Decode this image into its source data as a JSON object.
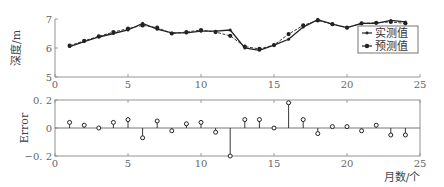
{
  "chart_data": [
    {
      "type": "line",
      "title": "",
      "xlabel": "",
      "ylabel": "深度/m",
      "xlim": [
        0,
        25
      ],
      "ylim": [
        5,
        7
      ],
      "xticks": [
        0,
        5,
        10,
        15,
        20,
        25
      ],
      "yticks": [
        5,
        6,
        7
      ],
      "grid": false,
      "legend_position": "inside-right",
      "x": [
        1,
        2,
        3,
        4,
        5,
        6,
        7,
        8,
        9,
        10,
        11,
        12,
        13,
        14,
        15,
        16,
        17,
        18,
        19,
        20,
        21,
        22,
        23,
        24
      ],
      "series": [
        {
          "name": "实测值",
          "marker": "dot-small",
          "line": "solid",
          "values": [
            6.05,
            6.22,
            6.38,
            6.5,
            6.62,
            6.85,
            6.65,
            6.52,
            6.52,
            6.58,
            6.58,
            6.62,
            6.0,
            5.92,
            6.1,
            6.3,
            6.72,
            6.98,
            6.82,
            6.7,
            6.85,
            6.85,
            6.95,
            6.9
          ]
        },
        {
          "name": "预测值",
          "marker": "dot",
          "line": "dashed",
          "values": [
            6.08,
            6.25,
            6.4,
            6.55,
            6.67,
            6.78,
            6.7,
            6.5,
            6.55,
            6.62,
            6.55,
            6.42,
            6.05,
            5.97,
            6.1,
            6.48,
            6.78,
            6.95,
            6.82,
            6.7,
            6.85,
            6.87,
            6.9,
            6.85
          ]
        }
      ]
    },
    {
      "type": "stem",
      "title": "",
      "xlabel": "月数/个",
      "ylabel": "Error",
      "xlim": [
        0,
        25
      ],
      "ylim": [
        -0.2,
        0.2
      ],
      "xticks": [
        0,
        5,
        10,
        15,
        20,
        25
      ],
      "yticks": [
        -0.2,
        0,
        0.2
      ],
      "ytick_labels": [
        "−0. 2",
        "0",
        "0. 2"
      ],
      "grid": false,
      "x": [
        1,
        2,
        3,
        4,
        5,
        6,
        7,
        8,
        9,
        10,
        11,
        12,
        13,
        14,
        15,
        16,
        17,
        18,
        19,
        20,
        21,
        22,
        23,
        24
      ],
      "series": [
        {
          "name": "Error",
          "values": [
            0.04,
            0.02,
            0.0,
            0.04,
            0.06,
            -0.07,
            0.05,
            -0.02,
            0.03,
            0.04,
            -0.03,
            -0.2,
            0.06,
            0.06,
            0.0,
            0.18,
            0.06,
            -0.04,
            0.01,
            0.01,
            -0.02,
            0.02,
            -0.05,
            -0.05
          ]
        }
      ]
    }
  ],
  "colors": {
    "axis": "#888888",
    "line": "#222222",
    "marker": "#222222",
    "text": "#555555"
  }
}
